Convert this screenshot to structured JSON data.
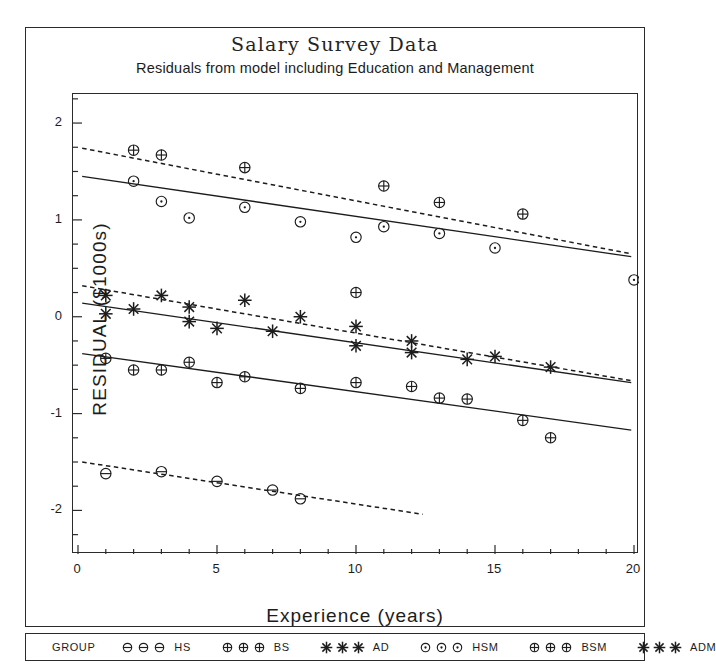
{
  "chart_data": {
    "type": "scatter",
    "title": "Salary Survey Data",
    "subtitle": "Residuals from model including Education and Management",
    "xlabel": "Experience (years)",
    "ylabel": "RESIDUAL ($1000s)",
    "xlim": [
      0,
      20
    ],
    "ylim": [
      -2.45,
      2.3
    ],
    "xticks": [
      0,
      5,
      10,
      15,
      20
    ],
    "xtick_labels": [
      "0",
      "5",
      "10",
      "15",
      "20"
    ],
    "xminor_step": 1,
    "yticks": [
      2,
      1,
      0,
      -1,
      -2
    ],
    "ytick_labels": [
      "2",
      "1",
      "0",
      "-1",
      "-2"
    ],
    "yminor_step": 0.25,
    "grid": false,
    "legend_position": "bottom-outside",
    "legend_title": "GROUP",
    "series": [
      {
        "name": "HS",
        "label": "HS",
        "marker": "circle-minus",
        "linestyle": "dotted",
        "points": [
          {
            "x": 1,
            "y": -1.62
          },
          {
            "x": 3,
            "y": -1.6
          },
          {
            "x": 5,
            "y": -1.7
          },
          {
            "x": 7,
            "y": -1.79
          },
          {
            "x": 8,
            "y": -1.88
          }
        ],
        "fit_line": {
          "x1": 0.15,
          "y1": -1.5,
          "x2": 12.4,
          "y2": -2.04
        }
      },
      {
        "name": "BS",
        "label": "BS",
        "marker": "circle-plus",
        "linestyle": "solid",
        "points": [
          {
            "x": 1,
            "y": -0.43
          },
          {
            "x": 2,
            "y": -0.55
          },
          {
            "x": 3,
            "y": -0.55
          },
          {
            "x": 4,
            "y": -0.47
          },
          {
            "x": 5,
            "y": -0.68
          },
          {
            "x": 6,
            "y": -0.62
          },
          {
            "x": 8,
            "y": -0.74
          },
          {
            "x": 10,
            "y": -0.68
          },
          {
            "x": 12,
            "y": -0.72
          },
          {
            "x": 13,
            "y": -0.84
          },
          {
            "x": 14,
            "y": -0.85
          },
          {
            "x": 16,
            "y": -1.07
          },
          {
            "x": 17,
            "y": -1.25
          }
        ],
        "fit_line": {
          "x1": 0.15,
          "y1": -0.38,
          "x2": 19.9,
          "y2": -1.17
        }
      },
      {
        "name": "AD",
        "label": "AD",
        "marker": "asterisk",
        "linestyle": "solid",
        "points": [
          {
            "x": 1,
            "y": 0.03
          },
          {
            "x": 2,
            "y": 0.08
          },
          {
            "x": 4,
            "y": -0.05
          },
          {
            "x": 5,
            "y": -0.12
          },
          {
            "x": 7,
            "y": -0.15
          },
          {
            "x": 10,
            "y": -0.3
          },
          {
            "x": 12,
            "y": -0.37
          },
          {
            "x": 14,
            "y": -0.44
          }
        ],
        "fit_line": {
          "x1": 0.15,
          "y1": 0.14,
          "x2": 19.9,
          "y2": -0.68
        }
      },
      {
        "name": "HSM",
        "label": "HSM",
        "marker": "circle-dot",
        "linestyle": "solid",
        "points": [
          {
            "x": 2,
            "y": 1.4
          },
          {
            "x": 3,
            "y": 1.19
          },
          {
            "x": 4,
            "y": 1.02
          },
          {
            "x": 6,
            "y": 1.13
          },
          {
            "x": 8,
            "y": 0.98
          },
          {
            "x": 10,
            "y": 0.82
          },
          {
            "x": 11,
            "y": 0.93
          },
          {
            "x": 13,
            "y": 0.86
          },
          {
            "x": 15,
            "y": 0.71
          },
          {
            "x": 20,
            "y": 0.38
          }
        ],
        "fit_line": {
          "x1": 0.15,
          "y1": 1.45,
          "x2": 19.9,
          "y2": 0.62
        }
      },
      {
        "name": "BSM",
        "label": "BSM",
        "marker": "circle-cross",
        "linestyle": "dotted",
        "points": [
          {
            "x": 2,
            "y": 1.72
          },
          {
            "x": 3,
            "y": 1.67
          },
          {
            "x": 6,
            "y": 1.54
          },
          {
            "x": 10,
            "y": 0.25
          },
          {
            "x": 11,
            "y": 1.35
          },
          {
            "x": 13,
            "y": 1.18
          },
          {
            "x": 16,
            "y": 1.06
          }
        ],
        "fit_line": {
          "x1": 0.15,
          "y1": 1.74,
          "x2": 19.9,
          "y2": 0.65
        }
      },
      {
        "name": "ADM",
        "label": "ADM",
        "marker": "asterisk",
        "linestyle": "dotted",
        "points": [
          {
            "x": 1,
            "y": 0.22
          },
          {
            "x": 3,
            "y": 0.22
          },
          {
            "x": 4,
            "y": 0.1
          },
          {
            "x": 6,
            "y": 0.17
          },
          {
            "x": 8,
            "y": 0.0
          },
          {
            "x": 10,
            "y": -0.1
          },
          {
            "x": 12,
            "y": -0.25
          },
          {
            "x": 15,
            "y": -0.41
          },
          {
            "x": 17,
            "y": -0.52
          }
        ],
        "fit_line": {
          "x1": 0.15,
          "y1": 0.32,
          "x2": 19.9,
          "y2": -0.66
        }
      }
    ]
  },
  "legend": {
    "title": "GROUP",
    "entries": [
      {
        "label": "HS",
        "marker": "circle-minus"
      },
      {
        "label": "BS",
        "marker": "circle-plus"
      },
      {
        "label": "AD",
        "marker": "asterisk"
      },
      {
        "label": "HSM",
        "marker": "circle-dot"
      },
      {
        "label": "BSM",
        "marker": "circle-cross"
      },
      {
        "label": "ADM",
        "marker": "asterisk"
      }
    ]
  },
  "colors": {
    "ink": "#1c1c1c",
    "frame": "#2b2b2b",
    "background": "#ffffff"
  }
}
